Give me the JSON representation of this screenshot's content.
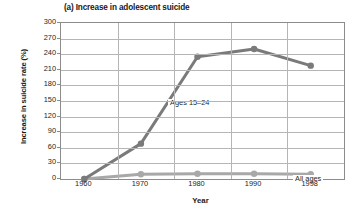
{
  "chart_data": {
    "type": "line",
    "title": "(a) Increase in adolescent suicide",
    "xlabel": "Year",
    "ylabel": "Increase in suicide rate (%)",
    "x": [
      1960,
      1970,
      1980,
      1990,
      1998
    ],
    "xticklabels": [
      "1960",
      "1970",
      "1980",
      "1990",
      "1998"
    ],
    "yticks": [
      0,
      30,
      60,
      90,
      120,
      150,
      180,
      210,
      240,
      270,
      300
    ],
    "yticklabels": [
      "0",
      "30",
      "60",
      "90",
      "120",
      "150",
      "180",
      "210",
      "240",
      "270",
      "300"
    ],
    "ylim": [
      0,
      300
    ],
    "grid": "both",
    "legend": "inline-labels",
    "series": [
      {
        "name": "Ages 15–24",
        "label": "Ages 15–24",
        "color": "#7a7a7a",
        "marker": "circle",
        "values": [
          0,
          68,
          235,
          250,
          218
        ]
      },
      {
        "name": "All ages",
        "label": "All ages",
        "color": "#a8a8a8",
        "marker": "circle",
        "values": [
          0,
          9,
          10,
          10,
          9
        ]
      }
    ],
    "annotations": [
      {
        "text": "Ages 15–24",
        "x": 1972,
        "y": 205
      },
      {
        "text": "All ages",
        "x": 1988,
        "y": 45
      }
    ]
  },
  "colors": {
    "line_adolescent": "#7a7a7a",
    "line_all_ages": "#a8a8a8",
    "gridline": "#b5b5b5",
    "frame": "#8c8c8c",
    "text": "#231f20",
    "background": "#ffffff"
  }
}
